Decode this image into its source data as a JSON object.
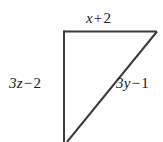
{
  "figure": {
    "type": "right-triangle-diagram",
    "background_color": "#ffffff",
    "stroke_color": "#3a3a42",
    "text_color": "#1a1a1a",
    "labels": {
      "top": {
        "full_text": "x + 2",
        "coefficient_variable": "x",
        "operator": "+",
        "constant": "2",
        "side": "top-horizontal"
      },
      "left": {
        "full_text": "3z − 2",
        "coefficient_variable": "3z",
        "operator": "−",
        "constant": "2",
        "side": "left-vertical"
      },
      "diagonal": {
        "full_text": "3y − 1",
        "coefficient_variable": "3y",
        "operator": "−",
        "constant": "1",
        "side": "diagonal-hypotenuse"
      }
    },
    "vertices": {
      "top_left": [
        63,
        31
      ],
      "top_right": [
        157,
        32
      ],
      "bottom_left_offscreen": [
        64,
        142
      ],
      "diagonal_bottom_offscreen": [
        68,
        142
      ]
    }
  }
}
